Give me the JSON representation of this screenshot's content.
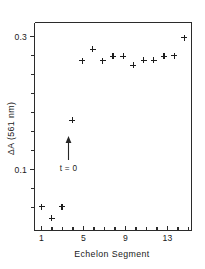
{
  "chart_data": {
    "type": "scatter",
    "title": "",
    "xlabel": "Echelon  Segment",
    "ylabel": "ΔA (561 nm)",
    "xlim": [
      0.3,
      15.7
    ],
    "ylim": [
      0.0,
      0.325
    ],
    "grid": false,
    "legend": null,
    "marker": "plus",
    "x_ticks_major": [
      1,
      5,
      9,
      13
    ],
    "x_tick_labels": [
      "1",
      "5",
      "9",
      "13"
    ],
    "x_ticks_minor": [
      2,
      3,
      4,
      6,
      7,
      8,
      10,
      11,
      12,
      14,
      15
    ],
    "y_ticks_major": [
      0.1,
      0.3
    ],
    "y_tick_labels": [
      "0.1",
      "0.3"
    ],
    "y_ticks_minor": [
      0.05,
      0.15,
      0.2,
      0.25
    ],
    "x": [
      1,
      2,
      3,
      4,
      5,
      6,
      7,
      8,
      9,
      10,
      11,
      12,
      13,
      14,
      15
    ],
    "values": [
      0.037,
      0.019,
      0.037,
      0.172,
      0.265,
      0.283,
      0.265,
      0.272,
      0.272,
      0.258,
      0.266,
      0.266,
      0.272,
      0.273,
      0.301
    ],
    "series": [
      {
        "name": "ΔA (561 nm)",
        "values": [
          0.037,
          0.019,
          0.037,
          0.172,
          0.265,
          0.283,
          0.265,
          0.272,
          0.272,
          0.258,
          0.266,
          0.266,
          0.272,
          0.273,
          0.301
        ]
      }
    ],
    "annotations": [
      {
        "name": "t-zero-arrow",
        "label": "t = 0",
        "x": 4.0,
        "y_tail": 0.145,
        "y_head": 0.178,
        "label_y": 0.118
      }
    ],
    "colors": {
      "axis": "#2b2b2b",
      "marker": "#1d1d1d",
      "background": "#ffffff",
      "text": "#1a1a1a"
    }
  }
}
